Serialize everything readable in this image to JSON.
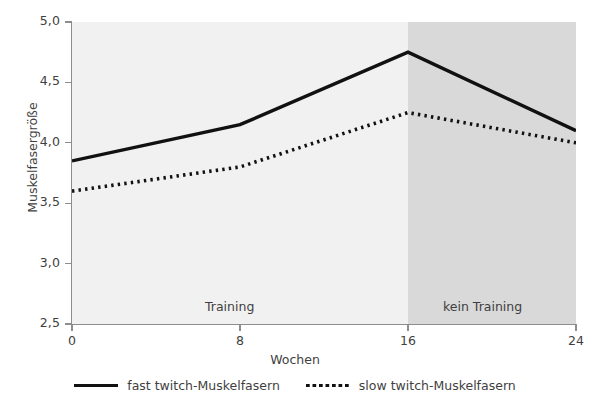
{
  "chart_data": {
    "type": "line",
    "title": "",
    "xlabel": "Wochen",
    "ylabel": "Muskelfasergröße",
    "xlim": [
      0,
      24
    ],
    "ylim": [
      2.5,
      5.0
    ],
    "xticks": [
      "0",
      "8",
      "16",
      "24"
    ],
    "xtick_values": [
      0,
      8,
      16,
      24
    ],
    "yticks": [
      "2,5",
      "3,0",
      "3,5",
      "4,0",
      "4,5",
      "5,0"
    ],
    "ytick_values": [
      2.5,
      3.0,
      3.5,
      4.0,
      4.5,
      5.0
    ],
    "grid": false,
    "legend_position": "bottom",
    "x": [
      0,
      8,
      16,
      24
    ],
    "series": [
      {
        "name": "fast twitch-Muskelfasern",
        "style": "solid",
        "color": "#111111",
        "values": [
          3.85,
          4.15,
          4.75,
          4.1
        ]
      },
      {
        "name": "slow twitch-Muskelfasern",
        "style": "dotted",
        "color": "#111111",
        "values": [
          3.6,
          3.8,
          4.25,
          4.0
        ]
      }
    ],
    "annotations": [
      {
        "text": "Training",
        "x_range": [
          0,
          16
        ],
        "shade": "#f1f1f1"
      },
      {
        "text": "kein Training",
        "x_range": [
          16,
          24
        ],
        "shade": "#d9d9d9"
      }
    ]
  },
  "legend": {
    "items": [
      {
        "label": "fast twitch-Muskelfasern",
        "style": "solid"
      },
      {
        "label": "slow twitch-Muskelfasern",
        "style": "dotted"
      }
    ]
  },
  "regions": {
    "training": "Training",
    "no_training": "kein Training"
  },
  "axes": {
    "x_title": "Wochen",
    "y_title": "Muskelfasergröße",
    "x_ticks": [
      "0",
      "8",
      "16",
      "24"
    ],
    "y_ticks": [
      "2,5",
      "3,0",
      "3,5",
      "4,0",
      "4,5",
      "5,0"
    ]
  },
  "top_crop": {
    "text": ""
  },
  "colors": {
    "line": "#111111",
    "axis": "#8d8d8d",
    "plot_background": "#f1f1f1",
    "shaded_background": "#d9d9d9",
    "text": "#3f3f3f"
  }
}
